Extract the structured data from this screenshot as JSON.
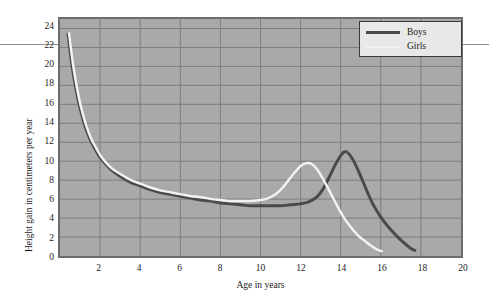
{
  "chart_data": {
    "type": "line",
    "title": "",
    "xlabel": "Age in years",
    "ylabel": "Height gain in centimeters per year",
    "xlim": [
      0,
      20
    ],
    "ylim": [
      0,
      25
    ],
    "grid": true,
    "legend_position": "top-right",
    "xticks": [
      2,
      4,
      6,
      8,
      10,
      12,
      14,
      16,
      18,
      20
    ],
    "yticks": [
      0,
      2,
      4,
      6,
      8,
      10,
      12,
      14,
      16,
      18,
      20,
      22,
      24
    ],
    "background_color": "#a9a9a9",
    "gridline_color": "#7d7d7d",
    "frame_color": "#6d6d6d",
    "series": [
      {
        "name": "Boys",
        "color": "#4a4a4a",
        "linewidth": 3,
        "points": [
          [
            0.4,
            23.4
          ],
          [
            0.6,
            20.1
          ],
          [
            0.8,
            17.6
          ],
          [
            1.0,
            15.6
          ],
          [
            1.25,
            13.7
          ],
          [
            1.5,
            12.3
          ],
          [
            1.75,
            11.3
          ],
          [
            2.0,
            10.4
          ],
          [
            2.5,
            9.2
          ],
          [
            3.0,
            8.4
          ],
          [
            3.5,
            7.8
          ],
          [
            4.0,
            7.4
          ],
          [
            4.5,
            7.0
          ],
          [
            5.0,
            6.7
          ],
          [
            5.5,
            6.5
          ],
          [
            6.0,
            6.3
          ],
          [
            6.5,
            6.1
          ],
          [
            7.0,
            5.9
          ],
          [
            7.5,
            5.8
          ],
          [
            8.0,
            5.6
          ],
          [
            8.5,
            5.5
          ],
          [
            9.0,
            5.4
          ],
          [
            9.5,
            5.3
          ],
          [
            10.0,
            5.3
          ],
          [
            10.5,
            5.3
          ],
          [
            11.0,
            5.3
          ],
          [
            11.5,
            5.4
          ],
          [
            12.0,
            5.5
          ],
          [
            12.4,
            5.7
          ],
          [
            12.8,
            6.2
          ],
          [
            13.1,
            7.0
          ],
          [
            13.4,
            8.2
          ],
          [
            13.7,
            9.5
          ],
          [
            14.0,
            10.6
          ],
          [
            14.2,
            11.0
          ],
          [
            14.4,
            10.8
          ],
          [
            14.7,
            9.8
          ],
          [
            15.0,
            8.4
          ],
          [
            15.3,
            6.9
          ],
          [
            15.6,
            5.5
          ],
          [
            16.0,
            4.1
          ],
          [
            16.4,
            3.0
          ],
          [
            16.8,
            2.1
          ],
          [
            17.2,
            1.3
          ],
          [
            17.5,
            0.8
          ],
          [
            17.7,
            0.6
          ]
        ]
      },
      {
        "name": "Girls",
        "color": "#f2f2f2",
        "linewidth": 2.5,
        "points": [
          [
            0.45,
            23.5
          ],
          [
            0.65,
            20.2
          ],
          [
            0.85,
            17.7
          ],
          [
            1.05,
            15.7
          ],
          [
            1.3,
            13.8
          ],
          [
            1.55,
            12.4
          ],
          [
            1.8,
            11.4
          ],
          [
            2.05,
            10.5
          ],
          [
            2.55,
            9.3
          ],
          [
            3.05,
            8.6
          ],
          [
            3.55,
            8.0
          ],
          [
            4.05,
            7.6
          ],
          [
            4.55,
            7.2
          ],
          [
            5.05,
            6.9
          ],
          [
            5.55,
            6.7
          ],
          [
            6.05,
            6.5
          ],
          [
            6.55,
            6.3
          ],
          [
            7.05,
            6.2
          ],
          [
            7.55,
            6.0
          ],
          [
            8.05,
            5.9
          ],
          [
            8.55,
            5.8
          ],
          [
            9.05,
            5.8
          ],
          [
            9.5,
            5.8
          ],
          [
            10.0,
            5.9
          ],
          [
            10.4,
            6.1
          ],
          [
            10.8,
            6.6
          ],
          [
            11.1,
            7.2
          ],
          [
            11.4,
            8.0
          ],
          [
            11.7,
            8.8
          ],
          [
            12.0,
            9.5
          ],
          [
            12.3,
            9.8
          ],
          [
            12.55,
            9.7
          ],
          [
            12.8,
            9.2
          ],
          [
            13.1,
            8.2
          ],
          [
            13.4,
            7.0
          ],
          [
            13.7,
            5.8
          ],
          [
            14.0,
            4.6
          ],
          [
            14.3,
            3.6
          ],
          [
            14.6,
            2.8
          ],
          [
            14.9,
            2.1
          ],
          [
            15.2,
            1.6
          ],
          [
            15.5,
            1.1
          ],
          [
            15.8,
            0.7
          ],
          [
            16.05,
            0.5
          ]
        ]
      }
    ],
    "legend": [
      {
        "label": "Boys",
        "color": "#4a4a4a"
      },
      {
        "label": "Girls",
        "color": "#f2f2f2"
      }
    ]
  }
}
